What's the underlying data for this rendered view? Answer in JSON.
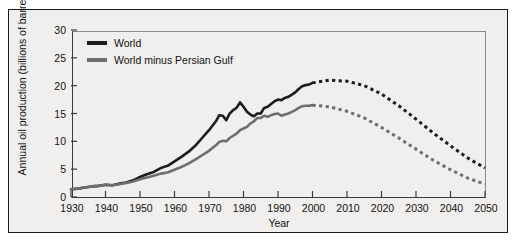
{
  "chart_data": {
    "type": "line",
    "title": "",
    "xlabel": "Year",
    "ylabel": "Annual oil production (billions of barrels)",
    "xlim": [
      1930,
      2050
    ],
    "ylim": [
      0,
      30
    ],
    "xticks": [
      1930,
      1940,
      1950,
      1960,
      1970,
      1980,
      1990,
      2000,
      2010,
      2020,
      2030,
      2040,
      2050
    ],
    "yticks": [
      0,
      5,
      10,
      15,
      20,
      25,
      30
    ],
    "grid": false,
    "legend_position": "top-left",
    "series": [
      {
        "name": "World",
        "color": "#1c1c1c",
        "historical_style": "solid",
        "projected_style": "dotted",
        "projection_starts": 2000,
        "x": [
          1930,
          1932,
          1934,
          1936,
          1938,
          1940,
          1942,
          1944,
          1946,
          1948,
          1950,
          1952,
          1954,
          1956,
          1958,
          1960,
          1962,
          1964,
          1966,
          1968,
          1970,
          1971,
          1972,
          1973,
          1974,
          1975,
          1976,
          1977,
          1978,
          1979,
          1980,
          1981,
          1982,
          1983,
          1984,
          1985,
          1986,
          1987,
          1988,
          1989,
          1990,
          1991,
          1992,
          1993,
          1994,
          1995,
          1996,
          1997,
          1998,
          1999,
          2000,
          2005,
          2010,
          2015,
          2020,
          2025,
          2030,
          2035,
          2040,
          2045,
          2050
        ],
        "y": [
          1.4,
          1.5,
          1.7,
          1.9,
          2.0,
          2.2,
          2.1,
          2.4,
          2.6,
          3.0,
          3.6,
          4.1,
          4.5,
          5.2,
          5.6,
          6.4,
          7.2,
          8.1,
          9.2,
          10.6,
          12.0,
          12.8,
          13.6,
          14.7,
          14.6,
          13.8,
          15.0,
          15.6,
          16.0,
          17.0,
          16.2,
          15.3,
          14.8,
          14.5,
          15.0,
          15.0,
          16.0,
          16.2,
          16.7,
          17.2,
          17.5,
          17.4,
          17.8,
          18.0,
          18.4,
          18.8,
          19.4,
          19.9,
          20.1,
          20.2,
          20.5,
          21.0,
          20.8,
          20.0,
          18.5,
          16.4,
          14.0,
          11.5,
          9.2,
          7.0,
          5.2
        ],
        "peak_year": 2005,
        "peak_value": 21.0,
        "value_2050": 5.2
      },
      {
        "name": "World minus Persian Gulf",
        "color": "#6e6e6e",
        "historical_style": "solid",
        "projected_style": "dotted",
        "projection_starts": 2000,
        "x": [
          1930,
          1932,
          1934,
          1936,
          1938,
          1940,
          1942,
          1944,
          1946,
          1948,
          1950,
          1952,
          1954,
          1956,
          1958,
          1960,
          1962,
          1964,
          1966,
          1968,
          1970,
          1971,
          1972,
          1973,
          1974,
          1975,
          1976,
          1977,
          1978,
          1979,
          1980,
          1981,
          1982,
          1983,
          1984,
          1985,
          1986,
          1987,
          1988,
          1989,
          1990,
          1991,
          1992,
          1993,
          1994,
          1995,
          1996,
          1997,
          1998,
          1999,
          2000,
          2005,
          2010,
          2015,
          2020,
          2025,
          2030,
          2035,
          2040,
          2045,
          2050
        ],
        "y": [
          1.4,
          1.5,
          1.7,
          1.9,
          2.0,
          2.2,
          2.1,
          2.3,
          2.5,
          2.8,
          3.2,
          3.5,
          3.8,
          4.2,
          4.4,
          4.9,
          5.4,
          6.0,
          6.7,
          7.5,
          8.3,
          8.8,
          9.3,
          9.9,
          10.1,
          10.0,
          10.6,
          11.0,
          11.4,
          12.0,
          12.3,
          12.6,
          13.2,
          13.6,
          14.2,
          14.2,
          14.6,
          14.4,
          14.7,
          14.9,
          15.0,
          14.6,
          14.8,
          15.0,
          15.3,
          15.6,
          16.0,
          16.3,
          16.4,
          16.4,
          16.5,
          16.2,
          15.4,
          14.2,
          12.5,
          10.6,
          8.6,
          6.6,
          4.9,
          3.4,
          2.3
        ],
        "peak_year": 1999,
        "peak_value": 16.5,
        "value_2050": 2.3
      }
    ]
  },
  "legend": {
    "items": [
      {
        "label": "World",
        "color": "#1c1c1c"
      },
      {
        "label": "World minus Persian Gulf",
        "color": "#6e6e6e"
      }
    ]
  },
  "axes": {
    "ylabel": "Annual oil production (billions of barrels)",
    "xlabel": "Year",
    "yticks": [
      "0",
      "5",
      "10",
      "15",
      "20",
      "25",
      "30"
    ],
    "xticks": [
      "1930",
      "1940",
      "1950",
      "1960",
      "1970",
      "1980",
      "1990",
      "2000",
      "2010",
      "2020",
      "2030",
      "2040",
      "2050"
    ]
  }
}
